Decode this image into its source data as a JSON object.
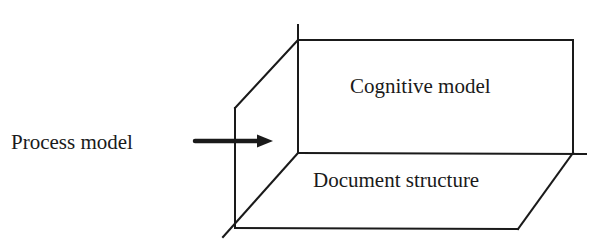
{
  "diagram": {
    "title": "",
    "colors": {
      "line": "#1a1a1a",
      "background": "#ffffff"
    },
    "labels": {
      "process_model": "Process model",
      "cognitive_model": "Cognitive model",
      "document_structure": "Document structure"
    },
    "planes": [
      {
        "name": "back-plane",
        "label": "Cognitive model",
        "orientation": "vertical, facing viewer"
      },
      {
        "name": "floor-plane",
        "label": "Document structure",
        "orientation": "horizontal, receding"
      },
      {
        "name": "side-plane",
        "label": "",
        "orientation": "vertical, left side, receding"
      }
    ],
    "arrow": {
      "from": "Process model",
      "to": "side-plane",
      "direction": "right",
      "icon": "arrow-right-icon"
    }
  }
}
